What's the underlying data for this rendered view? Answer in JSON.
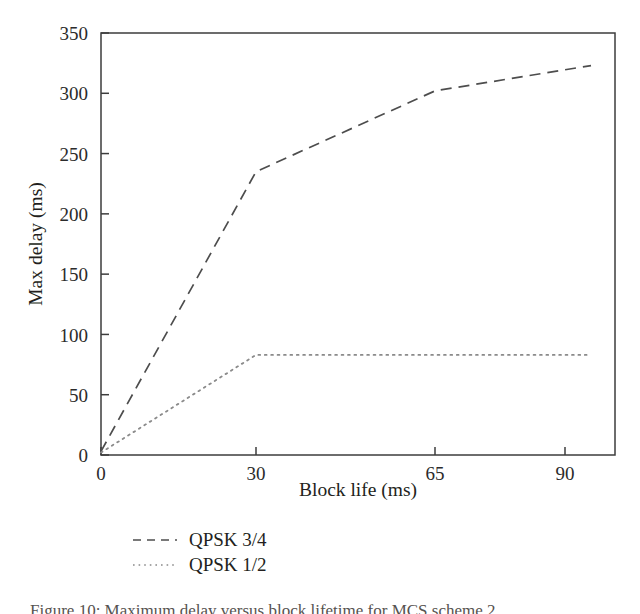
{
  "chart_data": {
    "type": "line",
    "title": "",
    "xlabel": "Block life (ms)",
    "ylabel": "Max delay (ms)",
    "xlim": [
      0,
      95
    ],
    "ylim": [
      0,
      350
    ],
    "xticks": [
      0,
      30,
      65,
      90
    ],
    "xtick_labels": [
      "0",
      "30",
      "65",
      "90"
    ],
    "yticks": [
      0,
      50,
      100,
      150,
      200,
      250,
      300,
      350
    ],
    "ytick_labels": [
      "0",
      "50",
      "100",
      "150",
      "200",
      "250",
      "300",
      "350"
    ],
    "grid": false,
    "legend_position": "below-axes-left",
    "series": [
      {
        "name": "QPSK 3/4",
        "style": "dashed",
        "color": "#4d4d4d",
        "x": [
          0,
          30,
          65,
          95
        ],
        "values": [
          3,
          235,
          302,
          323
        ]
      },
      {
        "name": "QPSK 1/2",
        "style": "dotted",
        "color": "#4d4d4d",
        "x": [
          0,
          30,
          65,
          95
        ],
        "values": [
          2,
          83,
          83,
          83
        ]
      }
    ]
  },
  "axes": {
    "x_title": "Block life (ms)",
    "y_title": "Max delay (ms)"
  },
  "legend": {
    "entries": [
      {
        "label": "QPSK 3/4",
        "style": "dashed"
      },
      {
        "label": "QPSK 1/2",
        "style": "dotted"
      }
    ]
  },
  "caption": {
    "text": "Figure 10: Maximum delay versus block lifetime for MCS scheme 2"
  }
}
